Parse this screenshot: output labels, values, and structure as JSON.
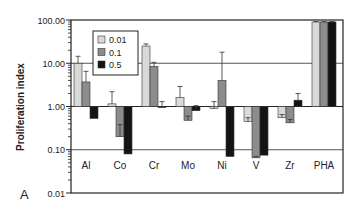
{
  "chart_data": {
    "type": "bar",
    "panel_label": "A",
    "title": "",
    "xlabel": "",
    "ylabel": "Proliferation index",
    "yscale": "log",
    "ylim": [
      0.01,
      100
    ],
    "yticks": [
      "100.00",
      "10.00",
      "1.00",
      "0.10",
      "0.01"
    ],
    "ytick_values": [
      100,
      10,
      1,
      0.1,
      0.01
    ],
    "baseline": 1,
    "grid": "horizontal at 10 and 0.1",
    "legend_position": "upper-left inside",
    "categories": [
      "Al",
      "Co",
      "Cr",
      "Mo",
      "Ni",
      "V",
      "Zr",
      "PHA"
    ],
    "series": [
      {
        "name": "0.01",
        "color": "#d9d9d9",
        "values": [
          10.0,
          1.15,
          25.0,
          1.6,
          0.9,
          0.45,
          0.55,
          90.0
        ],
        "errors": [
          14.5,
          2.2,
          28.0,
          2.9,
          1.3,
          0.55,
          0.65,
          92.0
        ]
      },
      {
        "name": "0.1",
        "color": "#8c8c8c",
        "values": [
          3.7,
          0.2,
          8.5,
          0.48,
          4.0,
          0.065,
          0.42,
          90.0
        ],
        "errors": [
          6.5,
          0.38,
          10.5,
          0.6,
          18.0,
          0.07,
          0.5,
          92.0
        ]
      },
      {
        "name": "0.5",
        "color": "#141414",
        "values": [
          0.53,
          0.08,
          0.95,
          0.8,
          0.07,
          0.075,
          1.4,
          90.0
        ],
        "errors": [
          0.53,
          0.08,
          1.3,
          1.05,
          0.07,
          0.075,
          2.0,
          92.0
        ]
      }
    ]
  }
}
